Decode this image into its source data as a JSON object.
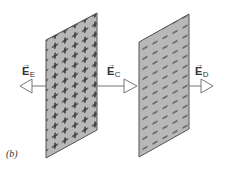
{
  "figure": {
    "caption": "(b)",
    "colors": {
      "plate_fill": "#b8b8b8",
      "plate_stroke": "#555555",
      "charge_mark": "#333333",
      "arrow_stroke": "#777777",
      "arrow_fill": "#ffffff",
      "label_text": "#333333"
    },
    "plates": [
      {
        "name": "positive-plate",
        "charge": "+",
        "points": "46,40 97,13 97,130 46,158"
      },
      {
        "name": "negative-plate",
        "charge": "−",
        "points": "139,42 189,14 189,129 139,157"
      }
    ],
    "field_labels": [
      {
        "id": "E",
        "letter": "E",
        "subscript": "E",
        "vector_mark": "→",
        "direction": "left"
      },
      {
        "id": "C",
        "letter": "E",
        "subscript": "C",
        "vector_mark": "→",
        "direction": "right"
      },
      {
        "id": "D",
        "letter": "E",
        "subscript": "D",
        "vector_mark": "→",
        "direction": "right"
      }
    ]
  }
}
